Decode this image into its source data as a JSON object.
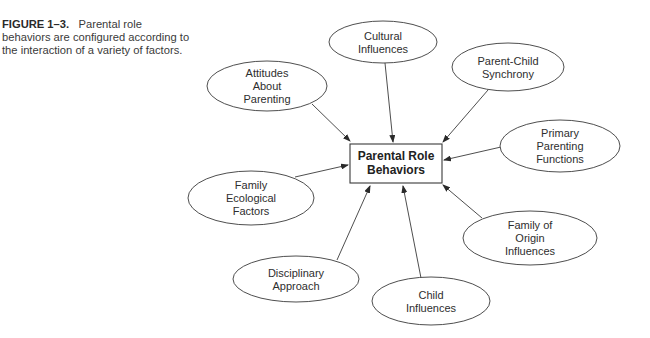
{
  "caption": {
    "label": "FIGURE 1–3.",
    "text": "Parental role behaviors are configured according to the interaction of a variety of factors."
  },
  "center": {
    "lines": [
      "Parental Role",
      "Behaviors"
    ],
    "x": 350,
    "y": 144,
    "w": 92,
    "h": 39
  },
  "nodes": [
    {
      "id": "cultural",
      "lines": [
        "Cultural",
        "Influences"
      ],
      "cx": 383,
      "cy": 42,
      "rx": 54,
      "ry": 21,
      "arrow": [
        385,
        63,
        393,
        142
      ]
    },
    {
      "id": "attitudes",
      "lines": [
        "Attitudes",
        "About",
        "Parenting"
      ],
      "cx": 267,
      "cy": 86,
      "rx": 60,
      "ry": 25,
      "arrow": [
        312,
        104,
        350,
        141
      ]
    },
    {
      "id": "parent-child",
      "lines": [
        "Parent-Child",
        "Synchrony"
      ],
      "cx": 508,
      "cy": 67,
      "rx": 56,
      "ry": 24,
      "arrow": [
        488,
        90,
        443,
        142
      ]
    },
    {
      "id": "primary",
      "lines": [
        "Primary",
        "Parenting",
        "Functions"
      ],
      "cx": 560,
      "cy": 146,
      "rx": 60,
      "ry": 26,
      "arrow": [
        501,
        147,
        444,
        160
      ]
    },
    {
      "id": "family-ecological",
      "lines": [
        "Family",
        "Ecological",
        "Factors"
      ],
      "cx": 251,
      "cy": 198,
      "rx": 63,
      "ry": 27,
      "arrow": [
        295,
        177,
        348,
        165
      ]
    },
    {
      "id": "family-origin",
      "lines": [
        "Family of",
        "Origin",
        "Influences"
      ],
      "cx": 530,
      "cy": 238,
      "rx": 67,
      "ry": 27,
      "arrow": [
        482,
        218,
        443,
        185
      ]
    },
    {
      "id": "disciplinary",
      "lines": [
        "Disciplinary",
        "Approach"
      ],
      "cx": 296,
      "cy": 279,
      "rx": 63,
      "ry": 23,
      "arrow": [
        337,
        260,
        370,
        186
      ]
    },
    {
      "id": "child",
      "lines": [
        "Child",
        "Influences"
      ],
      "cx": 431,
      "cy": 301,
      "rx": 59,
      "ry": 24,
      "arrow": [
        421,
        278,
        403,
        186
      ]
    }
  ],
  "colors": {
    "stroke": "#3a3a3a",
    "text": "#2e2e2e"
  }
}
